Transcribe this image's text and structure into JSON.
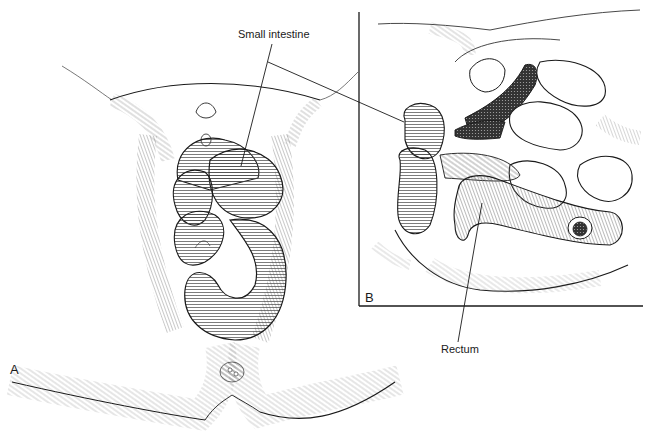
{
  "figure": {
    "type": "medical-line-illustration",
    "panels": [
      {
        "id": "A",
        "label": "A",
        "view": "external perineal view with prolapsed bowel loops"
      },
      {
        "id": "B",
        "label": "B",
        "view": "sagittal section of pelvis"
      }
    ]
  },
  "labels": {
    "small_intestine": "Small intestine",
    "rectum": "Rectum",
    "panel_a": "A",
    "panel_b": "B"
  },
  "colors": {
    "ink": "#1a1a1a",
    "hatch": "#555555",
    "background": "#ffffff"
  }
}
